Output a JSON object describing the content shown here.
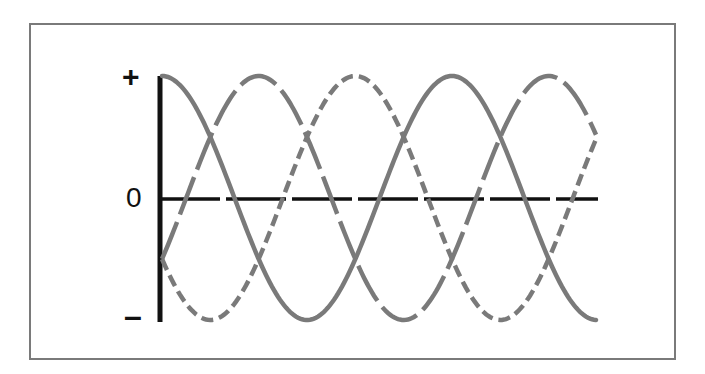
{
  "diagram": {
    "type": "three-phase waveform",
    "y_axis_labels": {
      "top": "+",
      "middle": "0",
      "bottom": "–"
    },
    "series": [
      {
        "name": "phase-1",
        "style": "solid",
        "phase_deg": 90
      },
      {
        "name": "phase-2",
        "style": "long-dash",
        "phase_deg": -30
      },
      {
        "name": "phase-3",
        "style": "short-dash",
        "phase_deg": 210
      }
    ],
    "colors": {
      "curve": "#7a7a7a",
      "axis": "#111111",
      "frame": "#7a7a7a"
    }
  }
}
